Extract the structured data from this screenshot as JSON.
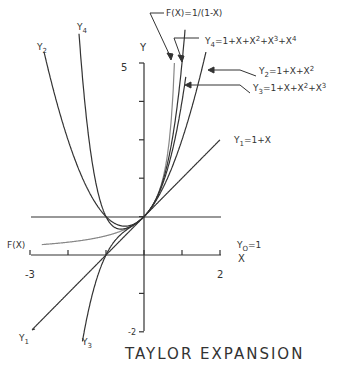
{
  "chart_data": {
    "type": "line",
    "title": "TAYLOR EXPANSION",
    "xlabel": "X",
    "ylabel": "Y",
    "xlim": [
      -3,
      2
    ],
    "ylim": [
      -2,
      5
    ],
    "x_ticks": [
      -3,
      -2,
      -1,
      0,
      1,
      2
    ],
    "x_tick_labels": {
      "-3": "-3",
      "2": "2"
    },
    "y_ticks": [
      -2,
      -1,
      0,
      1,
      2,
      3,
      4,
      5
    ],
    "y_tick_labels": {
      "5": "5",
      "-2": "-2"
    },
    "grid": false,
    "series": [
      {
        "name": "F(X)",
        "label": "F(X)=1/(1-X)",
        "coeffs": "1/(1-x)",
        "color": "#777777"
      },
      {
        "name": "Y0",
        "label": "Y0=1",
        "coeffs": [
          1
        ]
      },
      {
        "name": "Y1",
        "label": "Y1=1+X",
        "coeffs": [
          1,
          1
        ]
      },
      {
        "name": "Y2",
        "label": "Y2=1+X+X^2",
        "coeffs": [
          1,
          1,
          1
        ]
      },
      {
        "name": "Y3",
        "label": "Y3=1+X+X^2+X^3",
        "coeffs": [
          1,
          1,
          1,
          1
        ]
      },
      {
        "name": "Y4",
        "label": "Y4=1+X+X^2+X^3+X^4",
        "coeffs": [
          1,
          1,
          1,
          1,
          1
        ]
      }
    ],
    "annotations": [
      "Y2",
      "Y4",
      "Y1",
      "Y3",
      "F(X)",
      "Y0=1",
      "Y1=1+X",
      "Y2=1+X+X^2",
      "Y3=1+X+X^2+X^3",
      "Y4=1+X+X^2+X^3+X^4",
      "F(X)=1/(1-X)"
    ]
  },
  "labels": {
    "y_axis": "Y",
    "x_axis": "X",
    "tick_5": "5",
    "tick_m2": "-2",
    "tick_m3": "-3",
    "tick_2": "2",
    "title": "TAYLOR EXPANSION"
  },
  "colors": {
    "ink": "#333333",
    "fx": "#888888",
    "bg": "#ffffff"
  }
}
